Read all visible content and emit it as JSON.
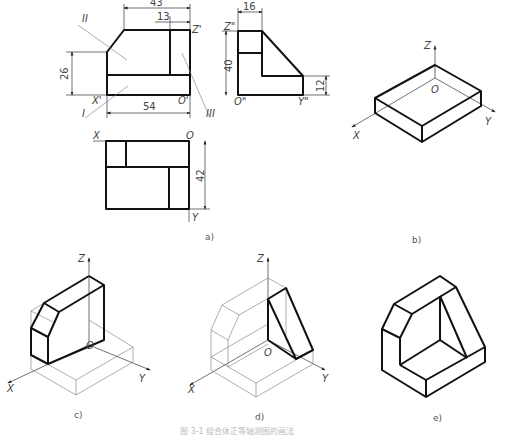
{
  "figure": {
    "caption": "图 3-1  组合体正等轴测图的画法",
    "subfigure_labels": {
      "a": "a)",
      "b": "b)",
      "c": "c)",
      "d": "d)",
      "e": "e)"
    }
  },
  "front_view": {
    "dims": {
      "top_width": "43",
      "notch": "13",
      "height": "26",
      "base_width": "54"
    },
    "axis_labels": {
      "z": "Z'",
      "x": "X'",
      "o": "O'"
    },
    "part_labels": {
      "p1": "I",
      "p2": "II",
      "p3": "III"
    }
  },
  "side_view": {
    "dims": {
      "top_width": "16",
      "height": "40",
      "step": "12"
    },
    "axis_labels": {
      "z": "Z\"",
      "o": "O\"",
      "y": "Y\""
    }
  },
  "top_view": {
    "dims": {
      "depth": "42"
    },
    "axis_labels": {
      "x": "X",
      "o": "O",
      "y": "Y"
    }
  },
  "iso_axes": {
    "z": "Z",
    "o": "O",
    "x": "X",
    "y": "Y"
  }
}
